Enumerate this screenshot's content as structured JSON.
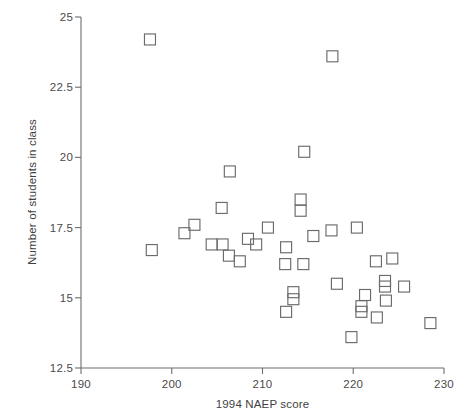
{
  "chart_data": {
    "type": "scatter",
    "title": "",
    "xlabel": "1994 NAEP score",
    "ylabel": "Number of students in class",
    "xlim": [
      190,
      230
    ],
    "ylim": [
      12.5,
      25
    ],
    "xticks": [
      190,
      200,
      210,
      220,
      230
    ],
    "yticks": [
      12.5,
      15,
      17.5,
      20,
      22.5,
      25
    ],
    "xtick_labels": [
      "190",
      "200",
      "210",
      "220",
      "230"
    ],
    "ytick_labels": [
      "12.5",
      "15",
      "17.5",
      "20",
      "22.5",
      "25"
    ],
    "grid": false,
    "legend": null,
    "marker_style": "open-square",
    "marker_color": "#6b6b6b",
    "points": [
      {
        "x": 197.6,
        "y": 24.2
      },
      {
        "x": 217.7,
        "y": 23.6
      },
      {
        "x": 214.6,
        "y": 20.2
      },
      {
        "x": 206.4,
        "y": 19.5
      },
      {
        "x": 214.2,
        "y": 18.5
      },
      {
        "x": 214.2,
        "y": 18.1
      },
      {
        "x": 205.5,
        "y": 18.2
      },
      {
        "x": 202.5,
        "y": 17.6
      },
      {
        "x": 201.4,
        "y": 17.3
      },
      {
        "x": 210.6,
        "y": 17.5
      },
      {
        "x": 217.6,
        "y": 17.4
      },
      {
        "x": 220.4,
        "y": 17.5
      },
      {
        "x": 215.6,
        "y": 17.2
      },
      {
        "x": 208.4,
        "y": 17.1
      },
      {
        "x": 209.3,
        "y": 16.9
      },
      {
        "x": 204.4,
        "y": 16.9
      },
      {
        "x": 205.6,
        "y": 16.9
      },
      {
        "x": 212.6,
        "y": 16.8
      },
      {
        "x": 197.8,
        "y": 16.7
      },
      {
        "x": 206.3,
        "y": 16.5
      },
      {
        "x": 207.5,
        "y": 16.3
      },
      {
        "x": 212.5,
        "y": 16.2
      },
      {
        "x": 214.5,
        "y": 16.2
      },
      {
        "x": 222.5,
        "y": 16.3
      },
      {
        "x": 224.3,
        "y": 16.4
      },
      {
        "x": 223.5,
        "y": 15.6
      },
      {
        "x": 223.5,
        "y": 15.4
      },
      {
        "x": 218.2,
        "y": 15.5
      },
      {
        "x": 225.6,
        "y": 15.4
      },
      {
        "x": 221.3,
        "y": 15.1
      },
      {
        "x": 213.4,
        "y": 15.2
      },
      {
        "x": 213.4,
        "y": 14.95
      },
      {
        "x": 223.6,
        "y": 14.9
      },
      {
        "x": 220.9,
        "y": 14.7
      },
      {
        "x": 220.9,
        "y": 14.5
      },
      {
        "x": 212.6,
        "y": 14.5
      },
      {
        "x": 222.6,
        "y": 14.3
      },
      {
        "x": 228.5,
        "y": 14.1
      },
      {
        "x": 219.8,
        "y": 13.6
      }
    ]
  },
  "axes": {
    "xaxis_title": "1994 NAEP score",
    "yaxis_title": "Number of students in class"
  }
}
